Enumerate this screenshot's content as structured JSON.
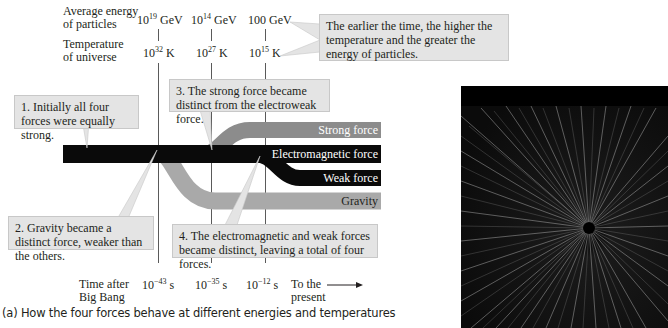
{
  "axes": {
    "energy_label_line1": "Average energy",
    "energy_label_line2": "of particles",
    "energies": [
      {
        "base": "10",
        "exp": "19",
        "unit": " GeV"
      },
      {
        "base": "10",
        "exp": "14",
        "unit": " GeV"
      },
      {
        "base": "",
        "exp": "",
        "unit": "100 GeV"
      }
    ],
    "temperature_label_line1": "Temperature",
    "temperature_label_line2": "of universe",
    "temperatures": [
      {
        "base": "10",
        "exp": "32",
        "unit": " K"
      },
      {
        "base": "10",
        "exp": "27",
        "unit": " K"
      },
      {
        "base": "10",
        "exp": "15",
        "unit": " K"
      }
    ],
    "time_label_line1": "Time after",
    "time_label_line2": "Big Bang",
    "times": [
      {
        "base": "10",
        "exp": "−43",
        "unit": " s"
      },
      {
        "base": "10",
        "exp": "−35",
        "unit": " s"
      },
      {
        "base": "10",
        "exp": "−12",
        "unit": " s"
      }
    ],
    "present_line1": "To the",
    "present_line2": "present"
  },
  "callouts": {
    "energy_note": "The earlier the time, the higher the temperature and the greater the energy of particles.",
    "step1": "1. Initially all four forces were equally strong.",
    "step2": "2. Gravity became a distinct force, weaker than the others.",
    "step3": "3. The strong force became distinct from the electroweak force.",
    "step4": "4. The electromagnetic and weak forces became distinct, leaving a total of four forces."
  },
  "forces": {
    "strong": "Strong force",
    "electromagnetic": "Electromagnetic force",
    "weak": "Weak force",
    "gravity": "Gravity"
  },
  "colors": {
    "unified": "#0a0a0a",
    "strong": "#8c8c8c",
    "gravity": "#a9a9a9",
    "callout_bg": "#e4e4e4"
  },
  "caption": "(a) How the four forces behave at different energies and temperatures"
}
